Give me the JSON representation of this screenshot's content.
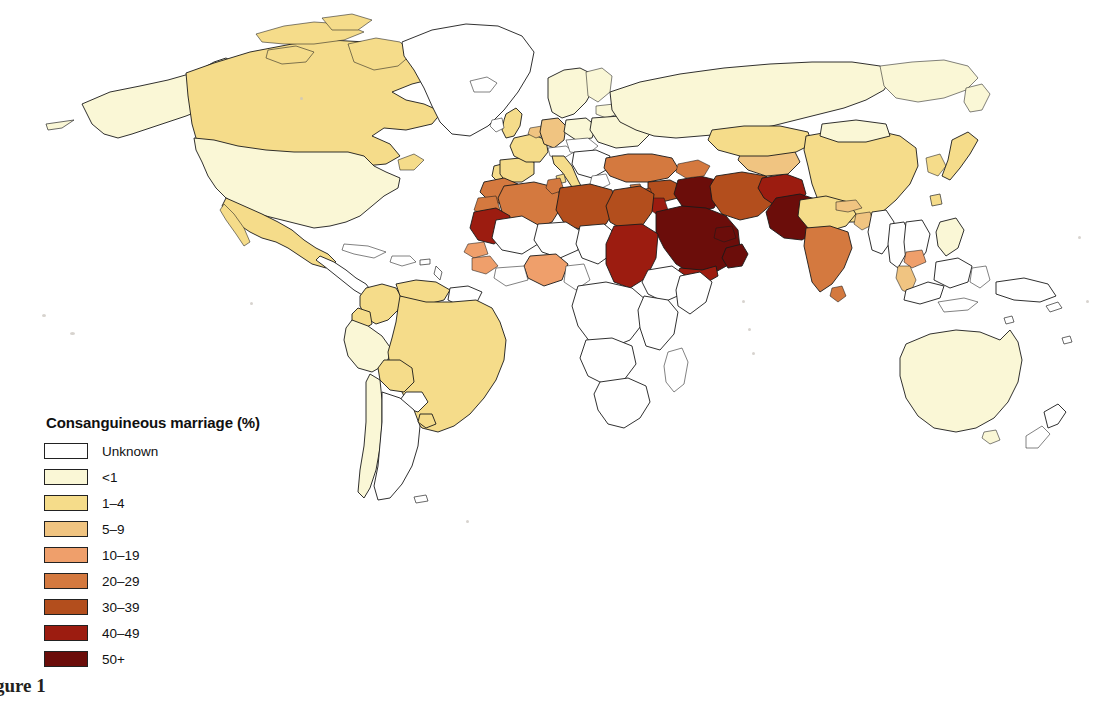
{
  "figure": {
    "caption": "Figure 1",
    "background_color": "#ffffff"
  },
  "legend": {
    "title": "Consanguineous marriage (%)",
    "items": [
      {
        "label": "Unknown",
        "color": "#ffffff"
      },
      {
        "label": "<1",
        "color": "#faf7d6"
      },
      {
        "label": "1–4",
        "color": "#f5dc8a"
      },
      {
        "label": "5–9",
        "color": "#f0c481"
      },
      {
        "label": "10–19",
        "color": "#ef9f6b"
      },
      {
        "label": "20–29",
        "color": "#d4793f"
      },
      {
        "label": "30–39",
        "color": "#b34e1d"
      },
      {
        "label": "40–49",
        "color": "#9c1c10"
      },
      {
        "label": "50+",
        "color": "#6b0d0a"
      }
    ]
  },
  "chart_data": {
    "type": "map",
    "title": "Consanguineous marriage (%)",
    "variable": "Consanguineous marriage (%)",
    "projection": "world",
    "legend_position": "bottom-left",
    "classes": [
      "Unknown",
      "<1",
      "1–4",
      "5–9",
      "10–19",
      "20–29",
      "30–39",
      "40–49",
      "50+"
    ],
    "class_colors": [
      "#ffffff",
      "#faf7d6",
      "#f5dc8a",
      "#f0c481",
      "#ef9f6b",
      "#d4793f",
      "#b34e1d",
      "#9c1c10",
      "#6b0d0a"
    ],
    "regions": [
      {
        "name": "Canada",
        "class": "1–4"
      },
      {
        "name": "United States",
        "class": "<1"
      },
      {
        "name": "Alaska",
        "class": "<1"
      },
      {
        "name": "Greenland",
        "class": "Unknown"
      },
      {
        "name": "Mexico",
        "class": "1–4"
      },
      {
        "name": "Central America",
        "class": "Unknown"
      },
      {
        "name": "Cuba",
        "class": "Unknown"
      },
      {
        "name": "Colombia",
        "class": "1–4"
      },
      {
        "name": "Venezuela",
        "class": "1–4"
      },
      {
        "name": "Brazil",
        "class": "1–4"
      },
      {
        "name": "Bolivia",
        "class": "1–4"
      },
      {
        "name": "Peru",
        "class": "<1"
      },
      {
        "name": "Ecuador",
        "class": "1–4"
      },
      {
        "name": "Chile",
        "class": "<1"
      },
      {
        "name": "Argentina",
        "class": "Unknown"
      },
      {
        "name": "Paraguay",
        "class": "Unknown"
      },
      {
        "name": "Uruguay",
        "class": "1–4"
      },
      {
        "name": "Guyanas",
        "class": "Unknown"
      },
      {
        "name": "United Kingdom",
        "class": "1–4"
      },
      {
        "name": "Ireland",
        "class": "Unknown"
      },
      {
        "name": "France",
        "class": "1–4"
      },
      {
        "name": "Spain",
        "class": "1–4"
      },
      {
        "name": "Portugal",
        "class": "1–4"
      },
      {
        "name": "Germany",
        "class": "5–9"
      },
      {
        "name": "Italy",
        "class": "1–4"
      },
      {
        "name": "Scandinavia",
        "class": "<1"
      },
      {
        "name": "Poland",
        "class": "<1"
      },
      {
        "name": "Eastern Europe",
        "class": "Unknown"
      },
      {
        "name": "Russia",
        "class": "<1"
      },
      {
        "name": "Turkey",
        "class": "20–29"
      },
      {
        "name": "Syria",
        "class": "30–39"
      },
      {
        "name": "Lebanon",
        "class": "30–39"
      },
      {
        "name": "Israel",
        "class": "30–39"
      },
      {
        "name": "Jordan",
        "class": "40–49"
      },
      {
        "name": "Iraq",
        "class": "50+"
      },
      {
        "name": "Iran",
        "class": "30–39"
      },
      {
        "name": "Saudi Arabia",
        "class": "50+"
      },
      {
        "name": "Yemen",
        "class": "40–49"
      },
      {
        "name": "Oman",
        "class": "50+"
      },
      {
        "name": "United Arab Emirates",
        "class": "50+"
      },
      {
        "name": "Kuwait",
        "class": "50+"
      },
      {
        "name": "Qatar",
        "class": "50+"
      },
      {
        "name": "Afghanistan",
        "class": "40–49"
      },
      {
        "name": "Pakistan",
        "class": "50+"
      },
      {
        "name": "Morocco",
        "class": "20–29"
      },
      {
        "name": "Algeria",
        "class": "20–29"
      },
      {
        "name": "Tunisia",
        "class": "20–29"
      },
      {
        "name": "Libya",
        "class": "30–39"
      },
      {
        "name": "Egypt",
        "class": "30–39"
      },
      {
        "name": "Mauritania",
        "class": "40–49"
      },
      {
        "name": "Senegal",
        "class": "10–19"
      },
      {
        "name": "Mali",
        "class": "Unknown"
      },
      {
        "name": "Niger",
        "class": "Unknown"
      },
      {
        "name": "Nigeria",
        "class": "10–19"
      },
      {
        "name": "Sudan",
        "class": "40–49"
      },
      {
        "name": "Chad",
        "class": "Unknown"
      },
      {
        "name": "Ethiopia",
        "class": "Unknown"
      },
      {
        "name": "Somalia",
        "class": "Unknown"
      },
      {
        "name": "Central Africa",
        "class": "Unknown"
      },
      {
        "name": "Southern Africa",
        "class": "Unknown"
      },
      {
        "name": "India (north)",
        "class": "1–4"
      },
      {
        "name": "India (south)",
        "class": "20–29"
      },
      {
        "name": "Bangladesh",
        "class": "5–9"
      },
      {
        "name": "Nepal",
        "class": "5–9"
      },
      {
        "name": "Sri Lanka",
        "class": "20–29"
      },
      {
        "name": "China",
        "class": "1–4"
      },
      {
        "name": "Mongolia",
        "class": "<1"
      },
      {
        "name": "Kazakhstan",
        "class": "1–4"
      },
      {
        "name": "Central Asia",
        "class": "5–9"
      },
      {
        "name": "Japan",
        "class": "1–4"
      },
      {
        "name": "Korea",
        "class": "1–4"
      },
      {
        "name": "Vietnam",
        "class": "Unknown"
      },
      {
        "name": "Cambodia",
        "class": "10–19"
      },
      {
        "name": "Thailand",
        "class": "Unknown"
      },
      {
        "name": "Malaysia",
        "class": "5–9"
      },
      {
        "name": "Indonesia",
        "class": "Unknown"
      },
      {
        "name": "Philippines",
        "class": "<1"
      },
      {
        "name": "Australia",
        "class": "<1"
      },
      {
        "name": "New Zealand",
        "class": "Unknown"
      }
    ]
  }
}
